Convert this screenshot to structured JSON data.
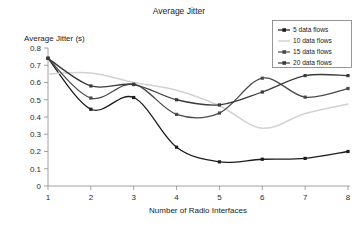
{
  "chart_data": {
    "type": "line",
    "title": "Average Jitter",
    "xlabel": "Number of Radio Interfaces",
    "ylabel": "Average Jitter (s)",
    "x": [
      1,
      2,
      3,
      4,
      5,
      6,
      7,
      8
    ],
    "xlim": [
      1,
      8
    ],
    "ylim": [
      0,
      0.8
    ],
    "xticks": [
      "1",
      "2",
      "3",
      "4",
      "5",
      "6",
      "7",
      "8"
    ],
    "yticks": [
      "0",
      "0.1",
      "0.2",
      "0.3",
      "0.4",
      "0.5",
      "0.6",
      "0.7",
      "0.8"
    ],
    "grid": false,
    "legend_position": "top-right",
    "smoothing": "spline",
    "series": [
      {
        "name": "5 data flows",
        "color": "#1c1c1c",
        "marker": "square",
        "values": [
          0.74,
          0.445,
          0.513,
          0.225,
          0.14,
          0.155,
          0.16,
          0.2
        ]
      },
      {
        "name": "10 data flows",
        "color": "#d2d2d2",
        "marker": "none",
        "values": [
          0.65,
          0.655,
          0.6,
          0.555,
          0.465,
          0.335,
          0.42,
          0.475
        ]
      },
      {
        "name": "15 data flows",
        "color": "#4a4a4a",
        "marker": "square",
        "values": [
          0.74,
          0.51,
          0.59,
          0.415,
          0.423,
          0.625,
          0.515,
          0.565
        ]
      },
      {
        "name": "20 data flows",
        "color": "#3a3a3a",
        "marker": "square",
        "values": [
          0.74,
          0.58,
          0.588,
          0.5,
          0.47,
          0.545,
          0.64,
          0.64
        ]
      }
    ]
  },
  "legend": {
    "items": [
      {
        "label": "5 data flows"
      },
      {
        "label": "10 data flows"
      },
      {
        "label": "15 data flows"
      },
      {
        "label": "20 data flows"
      }
    ]
  }
}
